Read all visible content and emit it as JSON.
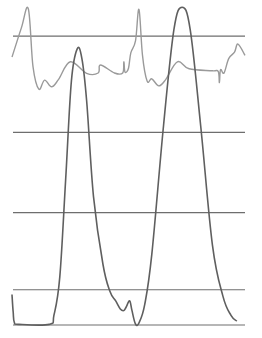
{
  "chart_data": {
    "type": "line",
    "title": "",
    "xlabel": "",
    "ylabel": "",
    "grid": true,
    "legend": "none",
    "xlim": [
      0,
      1
    ],
    "ylim": [
      0,
      100
    ],
    "gridlines_y": [
      0,
      11,
      35,
      60,
      90
    ],
    "series": [
      {
        "name": "ECG",
        "color": "#9a9a9a",
        "points": [
          [
            0.0,
            83.5
          ],
          [
            0.04,
            92.5
          ],
          [
            0.07,
            98.5
          ],
          [
            0.09,
            80.5
          ],
          [
            0.115,
            73.5
          ],
          [
            0.14,
            76.3
          ],
          [
            0.17,
            74.2
          ],
          [
            0.2,
            76.5
          ],
          [
            0.25,
            82.0
          ],
          [
            0.32,
            78.4
          ],
          [
            0.37,
            78.5
          ],
          [
            0.38,
            81.0
          ],
          [
            0.44,
            78.5
          ],
          [
            0.475,
            78.5
          ],
          [
            0.48,
            82.0
          ],
          [
            0.485,
            78.8
          ],
          [
            0.5,
            80.0
          ],
          [
            0.51,
            84.8
          ],
          [
            0.53,
            88.5
          ],
          [
            0.545,
            98.3
          ],
          [
            0.56,
            84.0
          ],
          [
            0.58,
            76.0
          ],
          [
            0.6,
            76.7
          ],
          [
            0.63,
            74.5
          ],
          [
            0.66,
            76.5
          ],
          [
            0.71,
            82.0
          ],
          [
            0.76,
            79.8
          ],
          [
            0.86,
            79.2
          ],
          [
            0.885,
            79.0
          ],
          [
            0.89,
            75.5
          ],
          [
            0.895,
            79.5
          ],
          [
            0.91,
            78.5
          ],
          [
            0.93,
            83.0
          ],
          [
            0.955,
            85.0
          ],
          [
            0.97,
            87.5
          ],
          [
            1.0,
            84.0
          ]
        ]
      },
      {
        "name": "Pressure",
        "color": "#5f5f5f",
        "points": [
          [
            0.0,
            9.5
          ],
          [
            0.005,
            4.0
          ],
          [
            0.01,
            0.8
          ],
          [
            0.03,
            0.2
          ],
          [
            0.16,
            0.2
          ],
          [
            0.18,
            3.0
          ],
          [
            0.205,
            15.0
          ],
          [
            0.23,
            45.0
          ],
          [
            0.255,
            76.0
          ],
          [
            0.28,
            86.0
          ],
          [
            0.3,
            83.0
          ],
          [
            0.32,
            70.0
          ],
          [
            0.35,
            40.0
          ],
          [
            0.39,
            19.0
          ],
          [
            0.42,
            10.5
          ],
          [
            0.445,
            7.5
          ],
          [
            0.465,
            5.0
          ],
          [
            0.48,
            4.5
          ],
          [
            0.49,
            5.6
          ],
          [
            0.505,
            7.5
          ],
          [
            0.515,
            4.5
          ],
          [
            0.53,
            0.3
          ],
          [
            0.545,
            0.7
          ],
          [
            0.57,
            6.5
          ],
          [
            0.6,
            22.0
          ],
          [
            0.65,
            62.0
          ],
          [
            0.695,
            92.0
          ],
          [
            0.73,
            99.0
          ],
          [
            0.765,
            92.0
          ],
          [
            0.81,
            62.0
          ],
          [
            0.86,
            25.0
          ],
          [
            0.905,
            9.0
          ],
          [
            0.94,
            3.0
          ],
          [
            0.965,
            1.2
          ]
        ]
      }
    ]
  }
}
